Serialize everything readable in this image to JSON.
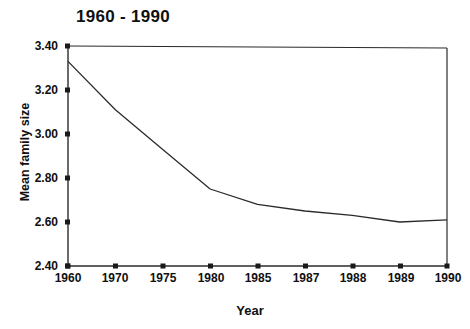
{
  "chart_data": {
    "type": "line",
    "title": "1960 - 1990",
    "xlabel": "Year",
    "ylabel": "Mean family size",
    "categories": [
      "1960",
      "1970",
      "1975",
      "1980",
      "1985",
      "1987",
      "1988",
      "1989",
      "1990"
    ],
    "values": [
      3.33,
      3.11,
      2.93,
      2.75,
      2.68,
      2.65,
      2.63,
      2.6,
      2.61
    ],
    "series": [
      {
        "name": "Mean family size",
        "values": [
          3.33,
          3.11,
          2.93,
          2.75,
          2.68,
          2.65,
          2.63,
          2.6,
          2.61
        ]
      }
    ],
    "ylim": [
      2.4,
      3.4
    ],
    "ytick_labels": [
      "3.40",
      "3.20",
      "3.00",
      "2.80",
      "2.60",
      "2.40"
    ],
    "ytick_values": [
      3.4,
      3.2,
      3.0,
      2.8,
      2.6,
      2.4
    ],
    "xtick_labels": [
      "1960",
      "1970",
      "1975",
      "1980",
      "1985",
      "1987",
      "1988",
      "1989",
      "1990"
    ],
    "grid": false,
    "legend": "none",
    "line_color": "#2b2b2b",
    "axis_color": "#2b2b2b",
    "background_color": "#ffffff"
  }
}
